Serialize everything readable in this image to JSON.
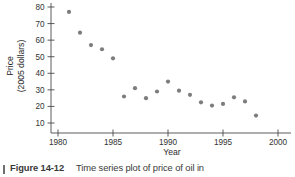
{
  "chart_data": {
    "type": "scatter",
    "title": "",
    "xlabel": "Year",
    "ylabel": "Price\n(2005 dollars)",
    "ylabel_line1": "Price",
    "ylabel_line2": "(2005 dollars)",
    "xlim": [
      1979.2,
      2000.8
    ],
    "ylim": [
      5,
      83
    ],
    "xticks": [
      1980,
      1985,
      1990,
      1995,
      2000
    ],
    "yticks": [
      10,
      20,
      30,
      40,
      50,
      60,
      70,
      80
    ],
    "grid": false,
    "legend": "none",
    "marker_color": "#7d7d7d",
    "axis_color": "#4a4a4a",
    "x": [
      1981,
      1982,
      1983,
      1984,
      1985,
      1986,
      1987,
      1988,
      1989,
      1990,
      1991,
      1992,
      1993,
      1994,
      1995,
      1996,
      1997,
      1998
    ],
    "values": [
      77,
      64.5,
      57,
      54.5,
      49,
      26,
      31,
      25,
      29,
      35,
      29.5,
      27,
      22.5,
      20.5,
      21.5,
      25.5,
      23,
      14.5
    ],
    "points": [
      {
        "year": 1981,
        "price": 77
      },
      {
        "year": 1982,
        "price": 64.5
      },
      {
        "year": 1983,
        "price": 57
      },
      {
        "year": 1984,
        "price": 54.5
      },
      {
        "year": 1985,
        "price": 49
      },
      {
        "year": 1986,
        "price": 26
      },
      {
        "year": 1987,
        "price": 31
      },
      {
        "year": 1988,
        "price": 25
      },
      {
        "year": 1989,
        "price": 29
      },
      {
        "year": 1990,
        "price": 35
      },
      {
        "year": 1991,
        "price": 29.5
      },
      {
        "year": 1992,
        "price": 27
      },
      {
        "year": 1993,
        "price": 22.5
      },
      {
        "year": 1994,
        "price": 20.5
      },
      {
        "year": 1995,
        "price": 21.5
      },
      {
        "year": 1996,
        "price": 25.5
      },
      {
        "year": 1997,
        "price": 23
      },
      {
        "year": 1998,
        "price": 14.5
      }
    ]
  },
  "caption": {
    "figure_number": "Figure 14-12",
    "text": "Time series plot of price of oil in"
  }
}
